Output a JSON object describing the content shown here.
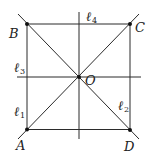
{
  "diagram": {
    "title": "",
    "points": {
      "A": {
        "label": "A",
        "x": 27,
        "y": 129
      },
      "B": {
        "label": "B",
        "x": 27,
        "y": 24
      },
      "C": {
        "label": "C",
        "x": 130,
        "y": 24
      },
      "D": {
        "label": "D",
        "x": 130,
        "y": 130
      },
      "O": {
        "label": "O",
        "x": 79,
        "y": 77
      }
    },
    "lines": {
      "l1": {
        "label": "ℓ",
        "sub": "1",
        "desc": "line AB (left side)"
      },
      "l2": {
        "label": "ℓ",
        "sub": "2",
        "desc": "line CD (right side)"
      },
      "l3": {
        "label": "ℓ",
        "sub": "3",
        "desc": "horizontal line through O"
      },
      "l4": {
        "label": "ℓ",
        "sub": "4",
        "desc": "vertical line through O"
      }
    },
    "colors": {
      "line": "#2b2b2b",
      "point": "#111111",
      "background": "#ffffff"
    }
  }
}
